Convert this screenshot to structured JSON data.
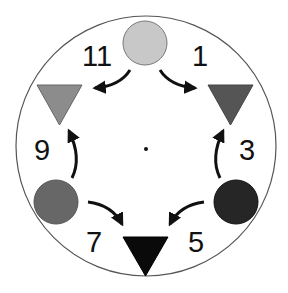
{
  "diagram": {
    "type": "clock-sequence",
    "center_dot": true,
    "clock": {
      "border_color": "#555555",
      "fill": "#ffffff"
    },
    "labels": {
      "l11": "11",
      "l1": "1",
      "l9": "9",
      "l3": "3",
      "l7": "7",
      "l5": "5"
    },
    "shapes": [
      {
        "position": "12",
        "shape": "circle",
        "color": "#c8c8c8"
      },
      {
        "position": "10",
        "shape": "triangle-down",
        "color": "#8c8c8c"
      },
      {
        "position": "2",
        "shape": "triangle-down",
        "color": "#555555"
      },
      {
        "position": "8",
        "shape": "circle",
        "color": "#676767"
      },
      {
        "position": "4",
        "shape": "circle",
        "color": "#262626"
      },
      {
        "position": "6",
        "shape": "triangle-down",
        "color": "#0a0a0a"
      }
    ],
    "arrows": [
      {
        "from": "12",
        "to": "10"
      },
      {
        "from": "12",
        "to": "2"
      },
      {
        "from": "8",
        "to": "10"
      },
      {
        "from": "4",
        "to": "2"
      },
      {
        "from": "8",
        "to": "6"
      },
      {
        "from": "4",
        "to": "6"
      }
    ]
  }
}
